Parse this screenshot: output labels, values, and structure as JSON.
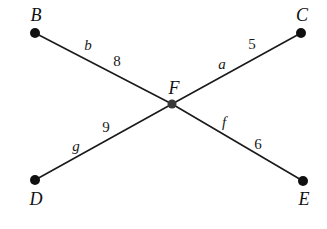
{
  "figure": {
    "width": 327,
    "height": 229,
    "background_color": "#ffffff",
    "line_color": "#1a1a1a",
    "node_color": "#101010",
    "center_node_color": "#3a3a3a"
  },
  "nodes": [
    {
      "id": "B",
      "label": "B",
      "x": 35,
      "y": 33,
      "radius": 5,
      "label_x": 36,
      "label_y": 15,
      "color": "#101010"
    },
    {
      "id": "C",
      "label": "C",
      "x": 301,
      "y": 33,
      "radius": 5,
      "label_x": 302,
      "label_y": 15,
      "color": "#101010"
    },
    {
      "id": "F",
      "label": "F",
      "x": 172,
      "y": 104,
      "radius": 4.5,
      "label_x": 174,
      "label_y": 88,
      "color": "#3a3a3a"
    },
    {
      "id": "D",
      "label": "D",
      "x": 35,
      "y": 180,
      "radius": 5,
      "label_x": 36,
      "label_y": 199,
      "color": "#101010"
    },
    {
      "id": "E",
      "label": "E",
      "x": 303,
      "y": 181,
      "radius": 5,
      "label_x": 304,
      "label_y": 199,
      "color": "#101010"
    }
  ],
  "edges": [
    {
      "id": "b",
      "from": "B",
      "to": "F",
      "name": "b",
      "weight": "8",
      "name_x": 88,
      "name_y": 45,
      "weight_x": 117,
      "weight_y": 61
    },
    {
      "id": "a",
      "from": "F",
      "to": "C",
      "name": "a",
      "weight": "5",
      "name_x": 222,
      "name_y": 64,
      "weight_x": 252,
      "weight_y": 44
    },
    {
      "id": "g",
      "from": "D",
      "to": "F",
      "name": "g",
      "weight": "9",
      "name_x": 76,
      "name_y": 146,
      "weight_x": 106,
      "weight_y": 127
    },
    {
      "id": "f",
      "from": "F",
      "to": "E",
      "name": "f",
      "weight": "6",
      "name_x": 224,
      "name_y": 122,
      "weight_x": 258,
      "weight_y": 144
    }
  ],
  "artifacts": [
    {
      "text": ".",
      "x": 150,
      "y": 178
    },
    {
      "text": ".",
      "x": 190,
      "y": 176
    }
  ]
}
